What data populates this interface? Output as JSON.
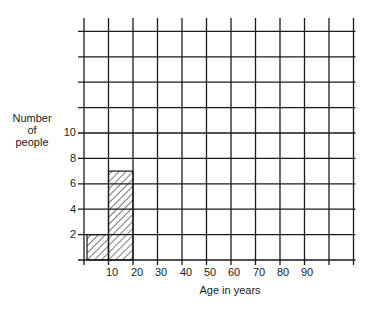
{
  "chart_data": {
    "type": "bar",
    "title": "",
    "xlabel": "Age in years",
    "ylabel": "Number of people",
    "x_tick_labels": [
      "10",
      "20",
      "30",
      "40",
      "50",
      "60",
      "70",
      "80",
      "90"
    ],
    "y_tick_labels": [
      "2",
      "4",
      "6",
      "8",
      "10"
    ],
    "bins": [
      "0-10",
      "10-20"
    ],
    "categories": [
      "0-10",
      "10-20"
    ],
    "values": [
      2,
      7
    ],
    "xlim": [
      0,
      110
    ],
    "ylim": [
      0,
      18
    ],
    "grid": true,
    "bar_fill": "hatched",
    "legend": null
  },
  "labels": {
    "ylabel_lines": [
      "Number",
      "of",
      "people"
    ],
    "xlabel": "Age in years"
  }
}
